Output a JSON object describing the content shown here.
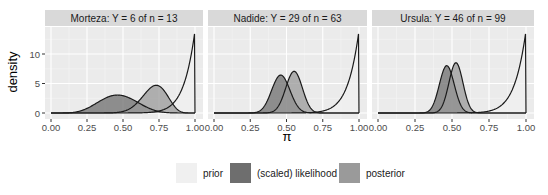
{
  "chart_data": {
    "type": "area",
    "ylabel": "density",
    "xlabel": "π",
    "xticks": [
      "0.00",
      "0.25",
      "0.50",
      "0.75",
      "1.00"
    ],
    "yticks": [
      "0",
      "5",
      "10"
    ],
    "ylim": [
      0,
      14
    ],
    "xlim": [
      0,
      1
    ],
    "grid": true,
    "legend_position": "bottom",
    "prior": {
      "alpha": 14,
      "beta": 1
    },
    "panels": [
      {
        "title": "Morteza: Y = 6 of n = 13",
        "y": 6,
        "n": 13
      },
      {
        "title": "Nadide: Y = 29 of n = 63",
        "y": 29,
        "n": 63
      },
      {
        "title": "Ursula: Y = 46 of n = 99",
        "y": 46,
        "n": 99
      }
    ],
    "series": [
      {
        "name": "prior",
        "color": "#f0f0f0"
      },
      {
        "name": "(scaled) likelihood",
        "color": "#6e6e6e"
      },
      {
        "name": "posterior",
        "color": "#9a9a9a"
      }
    ]
  },
  "legend": {
    "items": [
      {
        "label": "prior",
        "color": "#f0f0f0"
      },
      {
        "label": "(scaled) likelihood",
        "color": "#6e6e6e"
      },
      {
        "label": "posterior",
        "color": "#9a9a9a"
      }
    ]
  },
  "axes": {
    "ylabel": "density",
    "xlabel": "π"
  }
}
